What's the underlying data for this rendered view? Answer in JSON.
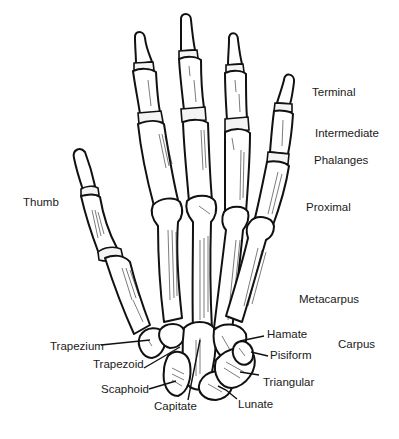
{
  "figure": {
    "ink_color": "#111111",
    "background": "#ffffff"
  },
  "labels": {
    "terminal": "Terminal",
    "intermediate": "Intermediate",
    "phalanges": "Phalanges",
    "proximal": "Proximal",
    "thumb": "Thumb",
    "metacarpus": "Metacarpus",
    "carpus": "Carpus",
    "hamate": "Hamate",
    "pisiform": "Pisiform",
    "triangular": "Triangular",
    "lunate": "Lunate",
    "capitate": "Capitate",
    "scaphoid": "Scaphoid",
    "trapezoid": "Trapezoid",
    "trapezium": "Trapezium"
  }
}
